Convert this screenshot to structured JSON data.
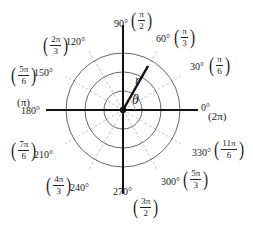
{
  "diagram": {
    "type": "polar-coordinate-grid",
    "center": {
      "x": 123,
      "y": 110
    },
    "circle_radii": [
      19,
      38,
      57
    ],
    "labels": {
      "r": "r",
      "theta": "θ"
    },
    "angles": [
      {
        "deg": "0°",
        "rad_num": "",
        "rad_den": "",
        "rad_plain": "(2π)"
      },
      {
        "deg": "30°",
        "rad_num": "π",
        "rad_den": "6"
      },
      {
        "deg": "60°",
        "rad_num": "π",
        "rad_den": "3"
      },
      {
        "deg": "90°",
        "rad_num": "π",
        "rad_den": "2"
      },
      {
        "deg": "120°",
        "rad_num": "2π",
        "rad_den": "3"
      },
      {
        "deg": "150°",
        "rad_num": "5π",
        "rad_den": "6"
      },
      {
        "deg": "180°",
        "rad_num": "",
        "rad_den": "",
        "rad_plain": "(π)"
      },
      {
        "deg": "210°",
        "rad_num": "7π",
        "rad_den": "6"
      },
      {
        "deg": "240°",
        "rad_num": "4π",
        "rad_den": "3"
      },
      {
        "deg": "270°",
        "rad_num": "3π",
        "rad_den": "2"
      },
      {
        "deg": "300°",
        "rad_num": "5π",
        "rad_den": "3"
      },
      {
        "deg": "330°",
        "rad_num": "11π",
        "rad_den": "6"
      }
    ],
    "colors": {
      "axis": "#111111",
      "circle": "#666666",
      "radial_guide": "#c8c8c8",
      "text": "#222222"
    }
  }
}
